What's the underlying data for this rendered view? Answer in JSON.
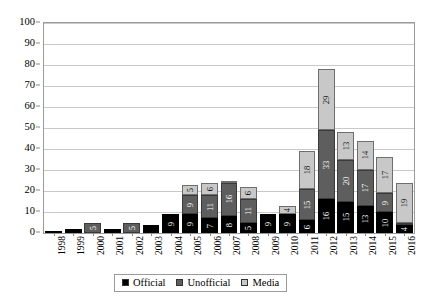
{
  "chart_data": {
    "type": "bar",
    "subtype": "stacked-column",
    "title": "",
    "xlabel": "",
    "ylabel": "",
    "ylim": [
      0,
      100
    ],
    "ytick_step": 10,
    "yticks": [
      0,
      10,
      20,
      30,
      40,
      50,
      60,
      70,
      80,
      90,
      100
    ],
    "grid": true,
    "legend_position": "bottom",
    "categories": [
      "1998",
      "1999",
      "2000",
      "2001",
      "2002",
      "2003",
      "2004",
      "2005",
      "2006",
      "2007",
      "2008",
      "2009",
      "2010",
      "2011",
      "2012",
      "2013",
      "2014",
      "2015",
      "2016"
    ],
    "series": [
      {
        "name": "Official",
        "color": "#000000",
        "values": [
          1,
          2,
          0,
          2,
          0,
          4,
          9,
          9,
          7,
          8,
          5,
          9,
          9,
          6,
          16,
          15,
          13,
          10,
          4
        ],
        "labels": [
          "",
          "",
          "",
          "",
          "",
          "",
          "9",
          "9",
          "7",
          "8",
          "5",
          "9",
          "9",
          "6",
          "16",
          "15",
          "13",
          "10",
          "4"
        ]
      },
      {
        "name": "Unofficial",
        "color": "#5e5e5e",
        "values": [
          0,
          0,
          5,
          0,
          5,
          0,
          0,
          9,
          11,
          16,
          11,
          0,
          0,
          15,
          33,
          20,
          17,
          9,
          1
        ],
        "labels": [
          "",
          "",
          "5",
          "",
          "5",
          "",
          "",
          "9",
          "11",
          "16",
          "11",
          "",
          "",
          "15",
          "33",
          "20",
          "17",
          "9",
          ""
        ]
      },
      {
        "name": "Media",
        "color": "#c8c8c8",
        "values": [
          0,
          0,
          0,
          0,
          0,
          0,
          0,
          5,
          6,
          1,
          6,
          0,
          4,
          18,
          29,
          13,
          14,
          17,
          19
        ],
        "labels": [
          "",
          "",
          "",
          "",
          "",
          "",
          "",
          "5",
          "6",
          "",
          "6",
          "",
          "4",
          "18",
          "29",
          "13",
          "14",
          "17",
          "19"
        ]
      }
    ],
    "totals": [
      1,
      2,
      5,
      2,
      5,
      4,
      9,
      23,
      24,
      25,
      22,
      9,
      13,
      39,
      78,
      48,
      44,
      36,
      24
    ]
  },
  "legend": {
    "items": [
      {
        "label": "Official",
        "key": "official"
      },
      {
        "label": "Unofficial",
        "key": "unofficial"
      },
      {
        "label": "Media",
        "key": "media"
      }
    ]
  }
}
